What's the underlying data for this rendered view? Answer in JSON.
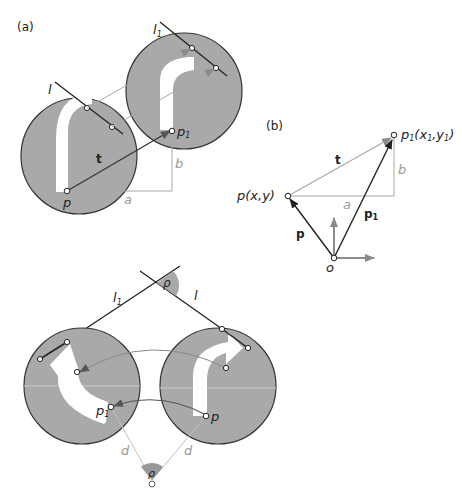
{
  "panel_a": {
    "label": "(a)",
    "line_l": "l",
    "line_l1": "l",
    "line_l1_sub": "1",
    "vector_t": "t",
    "point_p": "p",
    "point_p1": "p",
    "point_p1_sub": "1",
    "offset_a": "a",
    "offset_b": "b"
  },
  "panel_b": {
    "label": "(b)",
    "point_p": "p(x,y)",
    "point_p1": "p",
    "point_p1_sub": "1",
    "point_p1_coords": "(x",
    "point_p1_coords_sub": "1",
    "point_p1_coords_mid": ",y",
    "point_p1_coords_sub2": "1",
    "point_p1_coords_end": ")",
    "vector_t": "t",
    "vector_p": "p",
    "vector_p1": "p",
    "vector_p1_sub": "1",
    "offset_a": "a",
    "offset_b": "b",
    "origin": "o"
  },
  "panel_c": {
    "line_l": "l",
    "line_l1": "l",
    "line_l1_sub": "1",
    "angle_top": "ρ",
    "angle_bottom": "ρ",
    "point_p": "p",
    "point_p1": "p",
    "point_p1_sub": "1",
    "distance_left": "d",
    "distance_right": "d"
  },
  "colors": {
    "disc_fill": "#a9a9a9",
    "disc_stroke": "#333333",
    "arrow_fill": "#ffffff",
    "dark_line": "#222222",
    "grey_line": "#a8a8a8",
    "arrowhead": "#666666"
  }
}
